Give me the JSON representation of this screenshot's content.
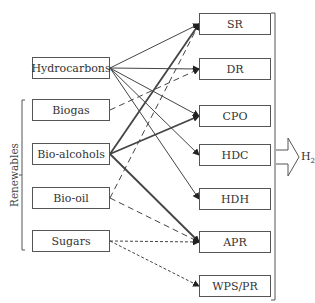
{
  "diagram": {
    "sources": [
      {
        "id": "hydrocarbons",
        "label": "Hydrocarbons",
        "top": 57
      },
      {
        "id": "biogas",
        "label": "Biogas",
        "top": 99
      },
      {
        "id": "bioalcohols",
        "label": "Bio-alcohols",
        "top": 143
      },
      {
        "id": "biooil",
        "label": "Bio-oil",
        "top": 187
      },
      {
        "id": "sugars",
        "label": "Sugars",
        "top": 230
      }
    ],
    "processes": [
      {
        "id": "sr",
        "label": "SR",
        "top": 13
      },
      {
        "id": "dr",
        "label": "DR",
        "top": 58
      },
      {
        "id": "cpo",
        "label": "CPO",
        "top": 105
      },
      {
        "id": "hdc",
        "label": "HDC",
        "top": 144
      },
      {
        "id": "hdh",
        "label": "HDH",
        "top": 188
      },
      {
        "id": "apr",
        "label": "APR",
        "top": 231
      },
      {
        "id": "wpspr",
        "label": "WPS/PR",
        "top": 275
      }
    ],
    "group_label": "Renewables",
    "output_label": "H",
    "output_subscript": "2",
    "edges": [
      {
        "from": "hydrocarbons",
        "to": "sr",
        "style": "solid"
      },
      {
        "from": "hydrocarbons",
        "to": "dr",
        "style": "solid"
      },
      {
        "from": "hydrocarbons",
        "to": "cpo",
        "style": "solid"
      },
      {
        "from": "hydrocarbons",
        "to": "hdc",
        "style": "solid"
      },
      {
        "from": "hydrocarbons",
        "to": "hdh",
        "style": "solid"
      },
      {
        "from": "biogas",
        "to": "dr",
        "style": "dashed"
      },
      {
        "from": "bioalcohols",
        "to": "sr",
        "style": "thick"
      },
      {
        "from": "bioalcohols",
        "to": "cpo",
        "style": "thick"
      },
      {
        "from": "bioalcohols",
        "to": "apr",
        "style": "thick"
      },
      {
        "from": "biooil",
        "to": "sr",
        "style": "dashed"
      },
      {
        "from": "biooil",
        "to": "apr",
        "style": "dashed"
      },
      {
        "from": "sugars",
        "to": "apr",
        "style": "dotted"
      },
      {
        "from": "sugars",
        "to": "wpspr",
        "style": "dotted"
      }
    ]
  }
}
